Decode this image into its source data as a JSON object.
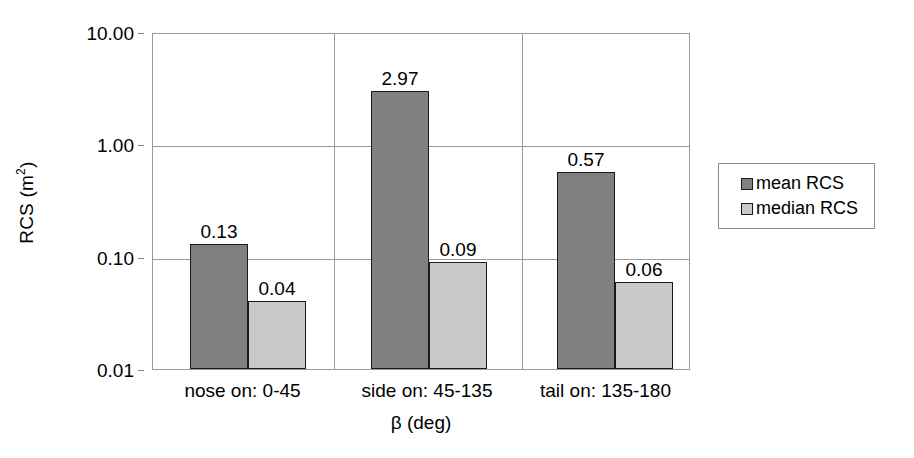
{
  "chart_data": {
    "type": "bar",
    "title": "",
    "subtitle": "",
    "xlabel": "β (deg)",
    "ylabel": "RCS (m²)",
    "ylabel_base": "RCS (m",
    "ylabel_sup": "2",
    "ylabel_close": ")",
    "yscale": "log",
    "ylim": [
      0.01,
      10.0
    ],
    "ytick_labels": [
      "10.00",
      "1.00",
      "0.10",
      "0.01"
    ],
    "ytick_values": [
      10.0,
      1.0,
      0.1,
      0.01
    ],
    "grid": "horizontal-and-category-dividers",
    "legend_position": "right-outside",
    "categories": [
      "nose on:  0-45",
      "side on: 45-135",
      "tail on: 135-180"
    ],
    "series": [
      {
        "name": "mean RCS",
        "color": "#808080",
        "values": [
          0.13,
          2.97,
          0.57
        ],
        "labels": [
          "0.13",
          "2.97",
          "0.57"
        ]
      },
      {
        "name": "median RCS",
        "color": "#c9c9c9",
        "values": [
          0.04,
          0.09,
          0.06
        ],
        "labels": [
          "0.04",
          "0.09",
          "0.06"
        ]
      }
    ]
  },
  "legend": {
    "items": [
      {
        "label": "mean RCS",
        "color": "#808080"
      },
      {
        "label": "median RCS",
        "color": "#c9c9c9"
      }
    ]
  },
  "colors": {
    "mean_bar": "#808080",
    "median_bar": "#c9c9c9",
    "bar_outline": "#1a1a1a",
    "gridline": "#9a9a9a",
    "axis": "#9a9a9a",
    "text": "#000000",
    "background": "#ffffff"
  }
}
